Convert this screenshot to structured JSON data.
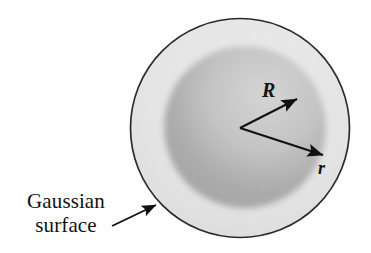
{
  "figure": {
    "background_color": "#fefefe",
    "labels": {
      "gaussian_surface": "Gaussian\nsurface",
      "radius_big": "R",
      "radius_small": "r"
    },
    "ghost_text": {
      "line1": "                    ",
      "line2": "                   ",
      "line3": "        ",
      "line4": "      "
    },
    "geometry": {
      "outer_circle": {
        "name": "gaussian-surface",
        "cx": 240,
        "cy": 128,
        "r": 110,
        "stroke": "#2b2b2b",
        "stroke_width": 1.6,
        "fill": "#e9e9e9"
      },
      "inner_sphere": {
        "name": "charged-sphere",
        "cx": 245,
        "cy": 127,
        "r": 83,
        "fill_light": "#d8d8d8",
        "fill_dark": "#a9a9a9"
      },
      "vertex": {
        "x": 240,
        "y": 128
      },
      "arrow_R": {
        "x1": 240,
        "y1": 128,
        "x2": 301,
        "y2": 97
      },
      "arrow_r": {
        "x1": 240,
        "y1": 128,
        "x2": 327,
        "y2": 157
      },
      "pointer_arrow": {
        "x1": 112,
        "y1": 225,
        "x2": 160,
        "y2": 203
      },
      "arrow_color": "#111111"
    }
  }
}
